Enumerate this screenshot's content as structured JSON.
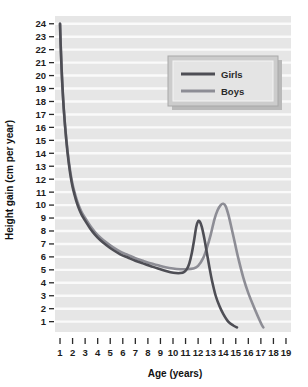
{
  "chart_data": {
    "type": "line",
    "title": "",
    "xlabel": "Age (years)",
    "ylabel": "Height gain (cm per year)",
    "xlim": [
      0.6,
      19.4
    ],
    "ylim": [
      0.2,
      24.6
    ],
    "xticks": [
      1,
      2,
      3,
      4,
      5,
      6,
      7,
      8,
      9,
      10,
      11,
      12,
      13,
      14,
      15,
      16,
      17,
      18,
      19
    ],
    "yticks": [
      1,
      2,
      3,
      4,
      5,
      6,
      7,
      8,
      9,
      10,
      11,
      12,
      13,
      14,
      15,
      16,
      17,
      18,
      19,
      20,
      21,
      22,
      23,
      24
    ],
    "grid": "horizontal-white-on-gray-bands",
    "legend_position": "upper-right",
    "plot_background": "#e6e6e6",
    "gridline_color": "#fafafa",
    "series": [
      {
        "name": "Girls",
        "color": "#4e4e55",
        "x": [
          1.0,
          1.05,
          1.15,
          1.3,
          1.5,
          1.7,
          1.9,
          2.1,
          2.4,
          2.7,
          3.0,
          3.4,
          3.8,
          4.2,
          4.7,
          5.2,
          5.8,
          6.4,
          7.0,
          7.6,
          8.2,
          8.8,
          9.3,
          9.8,
          10.2,
          10.6,
          10.9,
          11.1,
          11.3,
          11.5,
          11.7,
          11.85,
          12.0,
          12.15,
          12.3,
          12.5,
          12.7,
          12.9,
          13.1,
          13.4,
          13.7,
          14.0,
          14.4,
          14.8,
          15.1
        ],
        "y": [
          24.0,
          22.4,
          20.0,
          17.4,
          15.0,
          13.2,
          11.9,
          11.0,
          10.0,
          9.3,
          8.8,
          8.2,
          7.7,
          7.3,
          6.9,
          6.55,
          6.2,
          5.95,
          5.7,
          5.5,
          5.3,
          5.1,
          4.95,
          4.82,
          4.75,
          4.75,
          4.85,
          5.05,
          5.5,
          6.3,
          7.4,
          8.3,
          8.75,
          8.7,
          8.3,
          7.4,
          6.3,
          5.2,
          4.2,
          3.0,
          2.2,
          1.6,
          1.0,
          0.7,
          0.55
        ]
      },
      {
        "name": "Boys",
        "color": "#8d8d95",
        "x": [
          1.0,
          1.05,
          1.15,
          1.3,
          1.5,
          1.7,
          1.9,
          2.1,
          2.4,
          2.7,
          3.0,
          3.4,
          3.8,
          4.2,
          4.7,
          5.2,
          5.8,
          6.4,
          7.0,
          7.6,
          8.2,
          8.8,
          9.4,
          10.0,
          10.6,
          11.1,
          11.6,
          12.0,
          12.4,
          12.7,
          13.0,
          13.3,
          13.55,
          13.8,
          14.0,
          14.2,
          14.4,
          14.6,
          14.9,
          15.2,
          15.6,
          16.0,
          16.5,
          17.0,
          17.2
        ],
        "y": [
          24.0,
          22.4,
          20.0,
          17.4,
          15.1,
          13.4,
          12.1,
          11.2,
          10.2,
          9.5,
          9.0,
          8.4,
          7.9,
          7.5,
          7.1,
          6.75,
          6.4,
          6.15,
          5.9,
          5.7,
          5.5,
          5.35,
          5.2,
          5.1,
          5.05,
          5.05,
          5.1,
          5.3,
          5.9,
          6.7,
          7.7,
          8.9,
          9.6,
          10.0,
          10.1,
          9.9,
          9.3,
          8.5,
          7.2,
          5.9,
          4.4,
          3.2,
          2.0,
          0.9,
          0.55
        ]
      }
    ]
  },
  "legend": {
    "items": [
      {
        "label": "Girls"
      },
      {
        "label": "Boys"
      }
    ]
  }
}
